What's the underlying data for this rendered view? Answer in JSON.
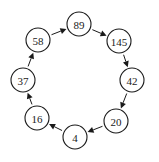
{
  "diagram": {
    "type": "cycle",
    "node_radius": 12,
    "colors": {
      "stroke": "#1a1a1a",
      "fill": "#ffffff",
      "text": "#1a1a1a"
    },
    "nodes": [
      {
        "id": "n89",
        "label": "89",
        "cx": 79,
        "cy": 24
      },
      {
        "id": "n145",
        "label": "145",
        "cx": 119,
        "cy": 41
      },
      {
        "id": "n42",
        "label": "42",
        "cx": 132,
        "cy": 80
      },
      {
        "id": "n20",
        "label": "20",
        "cx": 116,
        "cy": 121
      },
      {
        "id": "n4",
        "label": "4",
        "cx": 75,
        "cy": 137
      },
      {
        "id": "n16",
        "label": "16",
        "cx": 37,
        "cy": 118
      },
      {
        "id": "n37",
        "label": "37",
        "cx": 23,
        "cy": 80
      },
      {
        "id": "n58",
        "label": "58",
        "cx": 38,
        "cy": 40
      }
    ],
    "edges": [
      {
        "from": "n89",
        "to": "n145"
      },
      {
        "from": "n145",
        "to": "n42"
      },
      {
        "from": "n42",
        "to": "n20"
      },
      {
        "from": "n20",
        "to": "n4"
      },
      {
        "from": "n4",
        "to": "n16"
      },
      {
        "from": "n16",
        "to": "n37"
      },
      {
        "from": "n37",
        "to": "n58"
      },
      {
        "from": "n58",
        "to": "n89"
      }
    ]
  }
}
